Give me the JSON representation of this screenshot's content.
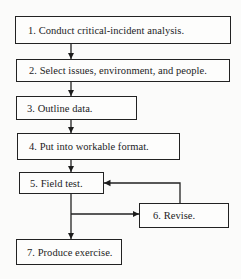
{
  "diagram": {
    "steps": [
      {
        "label": "1. Conduct critical-incident analysis."
      },
      {
        "label": "2. Select issues, environment, and people."
      },
      {
        "label": "3. Outline data."
      },
      {
        "label": "4. Put into workable format."
      },
      {
        "label": "5. Field test."
      },
      {
        "label": "6. Revise."
      },
      {
        "label": "7. Produce exercise."
      }
    ],
    "colors": {
      "line": "#222222",
      "background": "#fbfbfa"
    }
  }
}
